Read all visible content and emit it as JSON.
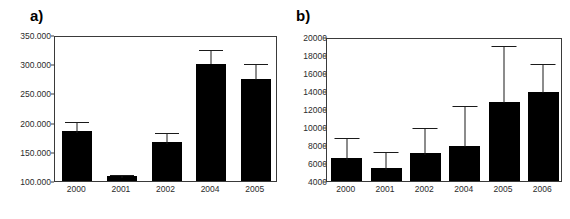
{
  "figure": {
    "background": "#ffffff",
    "bar_color": "#000000",
    "axis_color": "#3a3a3a",
    "error_color": "#1a1a1a"
  },
  "panels": [
    {
      "id": "a",
      "label": "a)"
    },
    {
      "id": "b",
      "label": "b)"
    }
  ],
  "chart_data": [
    {
      "panel": "a",
      "type": "bar",
      "title": "a)",
      "xlabel": "",
      "ylabel": "",
      "grid": false,
      "legend": "none",
      "ylim": [
        100000,
        350000
      ],
      "ytick_labels": [
        "350.000",
        "300.000",
        "250.000",
        "200.000",
        "150.000",
        "100.000"
      ],
      "ytick_values": [
        350000,
        300000,
        250000,
        200000,
        150000,
        100000
      ],
      "categories": [
        "2000",
        "2001",
        "2002",
        "2004",
        "2005"
      ],
      "values": [
        186000,
        108000,
        167000,
        304000,
        277000
      ],
      "value_labels": [
        "186.000",
        "108.000",
        "167.000",
        "304.000",
        "277.000"
      ],
      "error_high": [
        205000,
        113000,
        186000,
        327000,
        303000
      ],
      "error_low": [
        167000,
        103000,
        148000,
        281000,
        251000
      ],
      "errors": [
        19000,
        5000,
        19000,
        23000,
        26000
      ]
    },
    {
      "panel": "b",
      "type": "bar",
      "title": "b)",
      "xlabel": "",
      "ylabel": "",
      "grid": false,
      "legend": "none",
      "ylim": [
        4000,
        20000
      ],
      "ytick_labels": [
        "20000",
        "18000",
        "16000",
        "14000",
        "12000",
        "10000",
        "8000",
        "6000",
        "4000"
      ],
      "ytick_values": [
        20000,
        18000,
        16000,
        14000,
        12000,
        10000,
        8000,
        6000,
        4000
      ],
      "categories": [
        "2000",
        "2001",
        "2002",
        "2004",
        "2005",
        "2006"
      ],
      "values": [
        6600,
        5450,
        7150,
        8000,
        12900,
        14000
      ],
      "value_labels": [
        "6600",
        "5450",
        "7150",
        "8000",
        "12900",
        "14000"
      ],
      "error_high": [
        9000,
        7400,
        10100,
        12600,
        19200,
        17200
      ],
      "error_low": [
        4200,
        3500,
        4200,
        3400,
        6600,
        10800
      ],
      "errors": [
        2400,
        1950,
        2950,
        4600,
        6300,
        3200
      ]
    }
  ]
}
